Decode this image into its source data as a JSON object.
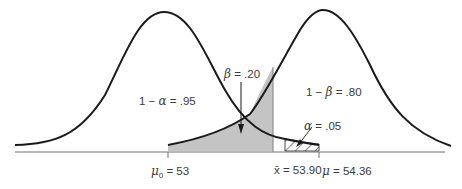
{
  "diagram": {
    "type": "hypothesis-test-power",
    "colors": {
      "curve": "#1a1a1a",
      "axis": "#707070",
      "beta_fill": "#c4c4c4",
      "text": "#3a3a3a"
    },
    "labels": {
      "left_region": {
        "prefix": "1 − ",
        "symbol": "α",
        "suffix": " = .95"
      },
      "right_region": {
        "prefix": "1 − ",
        "symbol": "β",
        "suffix": " = .80"
      },
      "beta": {
        "symbol": "β",
        "suffix": " = .20"
      },
      "alpha": {
        "symbol": "α",
        "suffix": " = .05"
      }
    },
    "axis_ticks": {
      "mu0": {
        "symbol": "μ",
        "sub": "0",
        "suffix": " = 53"
      },
      "xbar": {
        "symbol": "x̄",
        "suffix": " = 53.90"
      },
      "mu": {
        "symbol": "μ",
        "suffix": " = 54.36"
      }
    }
  }
}
